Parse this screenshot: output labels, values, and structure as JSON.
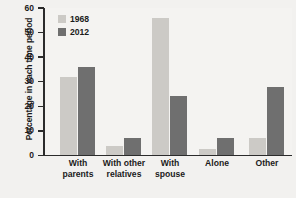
{
  "chart_data": {
    "type": "bar",
    "title": "",
    "xlabel": "",
    "ylabel": "Percentage in each time period",
    "ylim": [
      0,
      60
    ],
    "yticks": [
      0,
      10,
      20,
      30,
      40,
      50,
      60
    ],
    "grid": false,
    "legend_position": "top-left",
    "categories": [
      "With parents",
      "With other relatives",
      "With spouse",
      "Alone",
      "Other"
    ],
    "category_lines": [
      [
        "With",
        "parents"
      ],
      [
        "With other",
        "relatives"
      ],
      [
        "With",
        "spouse"
      ],
      [
        "Alone"
      ],
      [
        "Other"
      ]
    ],
    "series": [
      {
        "name": "1968",
        "color": "#cccac6",
        "values": [
          32,
          4,
          56,
          2.5,
          7
        ]
      },
      {
        "name": "2012",
        "color": "#6f6f6f",
        "values": [
          36,
          7,
          24,
          7,
          28
        ]
      }
    ]
  },
  "colors": {
    "background": "#f2f1ef",
    "plot_background": "#f4f3f1",
    "axis": "#2b2b2b",
    "text": "#1b1b1b",
    "series_1968": "#cccac6",
    "series_2012": "#6f6f6f"
  }
}
